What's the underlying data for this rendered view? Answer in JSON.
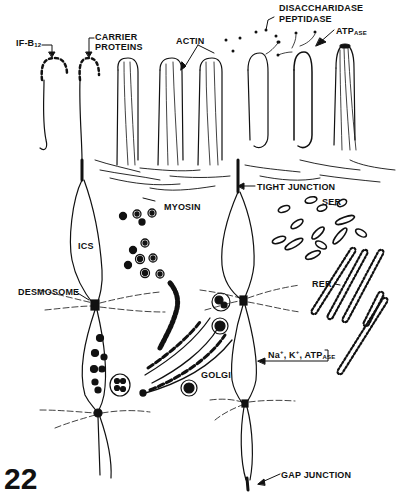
{
  "figure": {
    "number": "22"
  },
  "labels": {
    "if_b12": {
      "main": "IF-B",
      "sub": "12"
    },
    "carrier_proteins_line1": "CARRIER",
    "carrier_proteins_line2": "PROTEINS",
    "actin": "ACTIN",
    "disaccharidase": "DISACCHARIDASE",
    "peptidase": "PEPTIDASE",
    "atpase": {
      "main": "ATP",
      "sub": "ASE"
    },
    "tight_junction": "TIGHT JUNCTION",
    "myosin": "MYOSIN",
    "ser": "SER",
    "ics": "ICS",
    "rer": "RER",
    "desmosome": "DESMOSOME",
    "na_k_atpase": {
      "na": "Na",
      "k": "K",
      "plus": "+",
      "atp": "ATP",
      "sub": "ASE"
    },
    "golgi": "GOLGI",
    "gap_junction": "GAP JUNCTION"
  },
  "colors": {
    "ink": "#111111",
    "background": "#ffffff"
  }
}
